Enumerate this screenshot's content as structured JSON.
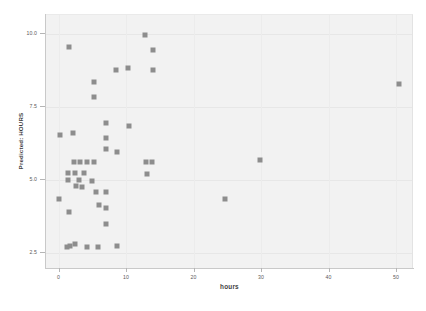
{
  "chart_data": {
    "type": "scatter",
    "title": "",
    "xlabel": "hours",
    "ylabel": "Predicted: HOURS",
    "xlim": [
      -2.0,
      52.5
    ],
    "ylim": [
      1.95,
      10.65
    ],
    "xticks": [
      0,
      10,
      20,
      30,
      40,
      50
    ],
    "xticklabels": [
      "0",
      "10",
      "20",
      "30",
      "40",
      "50"
    ],
    "yticks": [
      2.5,
      5.0,
      7.5,
      10.0
    ],
    "yticklabels": [
      "2.5",
      "5.0",
      "7.5",
      "10.0"
    ],
    "grid": true,
    "legend": null,
    "marker": "square",
    "marker_color": "#8d8d8d",
    "plot_background": "#f2f2f2",
    "figure_background": "#ffffff",
    "points": [
      {
        "x": 1.5,
        "y": 9.55
      },
      {
        "x": 12.8,
        "y": 9.95
      },
      {
        "x": 14.0,
        "y": 9.45
      },
      {
        "x": 8.5,
        "y": 8.75
      },
      {
        "x": 10.3,
        "y": 8.85
      },
      {
        "x": 14.0,
        "y": 8.75
      },
      {
        "x": 5.3,
        "y": 8.35
      },
      {
        "x": 5.3,
        "y": 7.85
      },
      {
        "x": 7.0,
        "y": 6.95
      },
      {
        "x": 10.4,
        "y": 6.85
      },
      {
        "x": 0.2,
        "y": 6.55
      },
      {
        "x": 2.2,
        "y": 6.6
      },
      {
        "x": 7.0,
        "y": 6.45
      },
      {
        "x": 7.0,
        "y": 6.05
      },
      {
        "x": 8.7,
        "y": 5.95
      },
      {
        "x": 2.3,
        "y": 5.6
      },
      {
        "x": 3.2,
        "y": 5.6
      },
      {
        "x": 4.2,
        "y": 5.6
      },
      {
        "x": 5.2,
        "y": 5.6
      },
      {
        "x": 13.0,
        "y": 5.6
      },
      {
        "x": 13.9,
        "y": 5.6
      },
      {
        "x": 1.4,
        "y": 5.25
      },
      {
        "x": 2.4,
        "y": 5.25
      },
      {
        "x": 3.8,
        "y": 5.25
      },
      {
        "x": 13.1,
        "y": 5.2
      },
      {
        "x": 1.4,
        "y": 5.0
      },
      {
        "x": 3.0,
        "y": 5.0
      },
      {
        "x": 4.9,
        "y": 4.95
      },
      {
        "x": 2.6,
        "y": 4.8
      },
      {
        "x": 3.5,
        "y": 4.75
      },
      {
        "x": 5.5,
        "y": 4.6
      },
      {
        "x": 7.0,
        "y": 4.6
      },
      {
        "x": 0.1,
        "y": 4.35
      },
      {
        "x": 24.6,
        "y": 4.35
      },
      {
        "x": 6.0,
        "y": 4.15
      },
      {
        "x": 7.0,
        "y": 4.05
      },
      {
        "x": 1.6,
        "y": 3.9
      },
      {
        "x": 7.0,
        "y": 3.5
      },
      {
        "x": 1.3,
        "y": 2.7
      },
      {
        "x": 1.7,
        "y": 2.75
      },
      {
        "x": 2.4,
        "y": 2.8
      },
      {
        "x": 4.2,
        "y": 2.7
      },
      {
        "x": 5.9,
        "y": 2.7
      },
      {
        "x": 8.6,
        "y": 2.75
      },
      {
        "x": 29.9,
        "y": 5.7
      },
      {
        "x": 50.4,
        "y": 8.3
      }
    ]
  }
}
